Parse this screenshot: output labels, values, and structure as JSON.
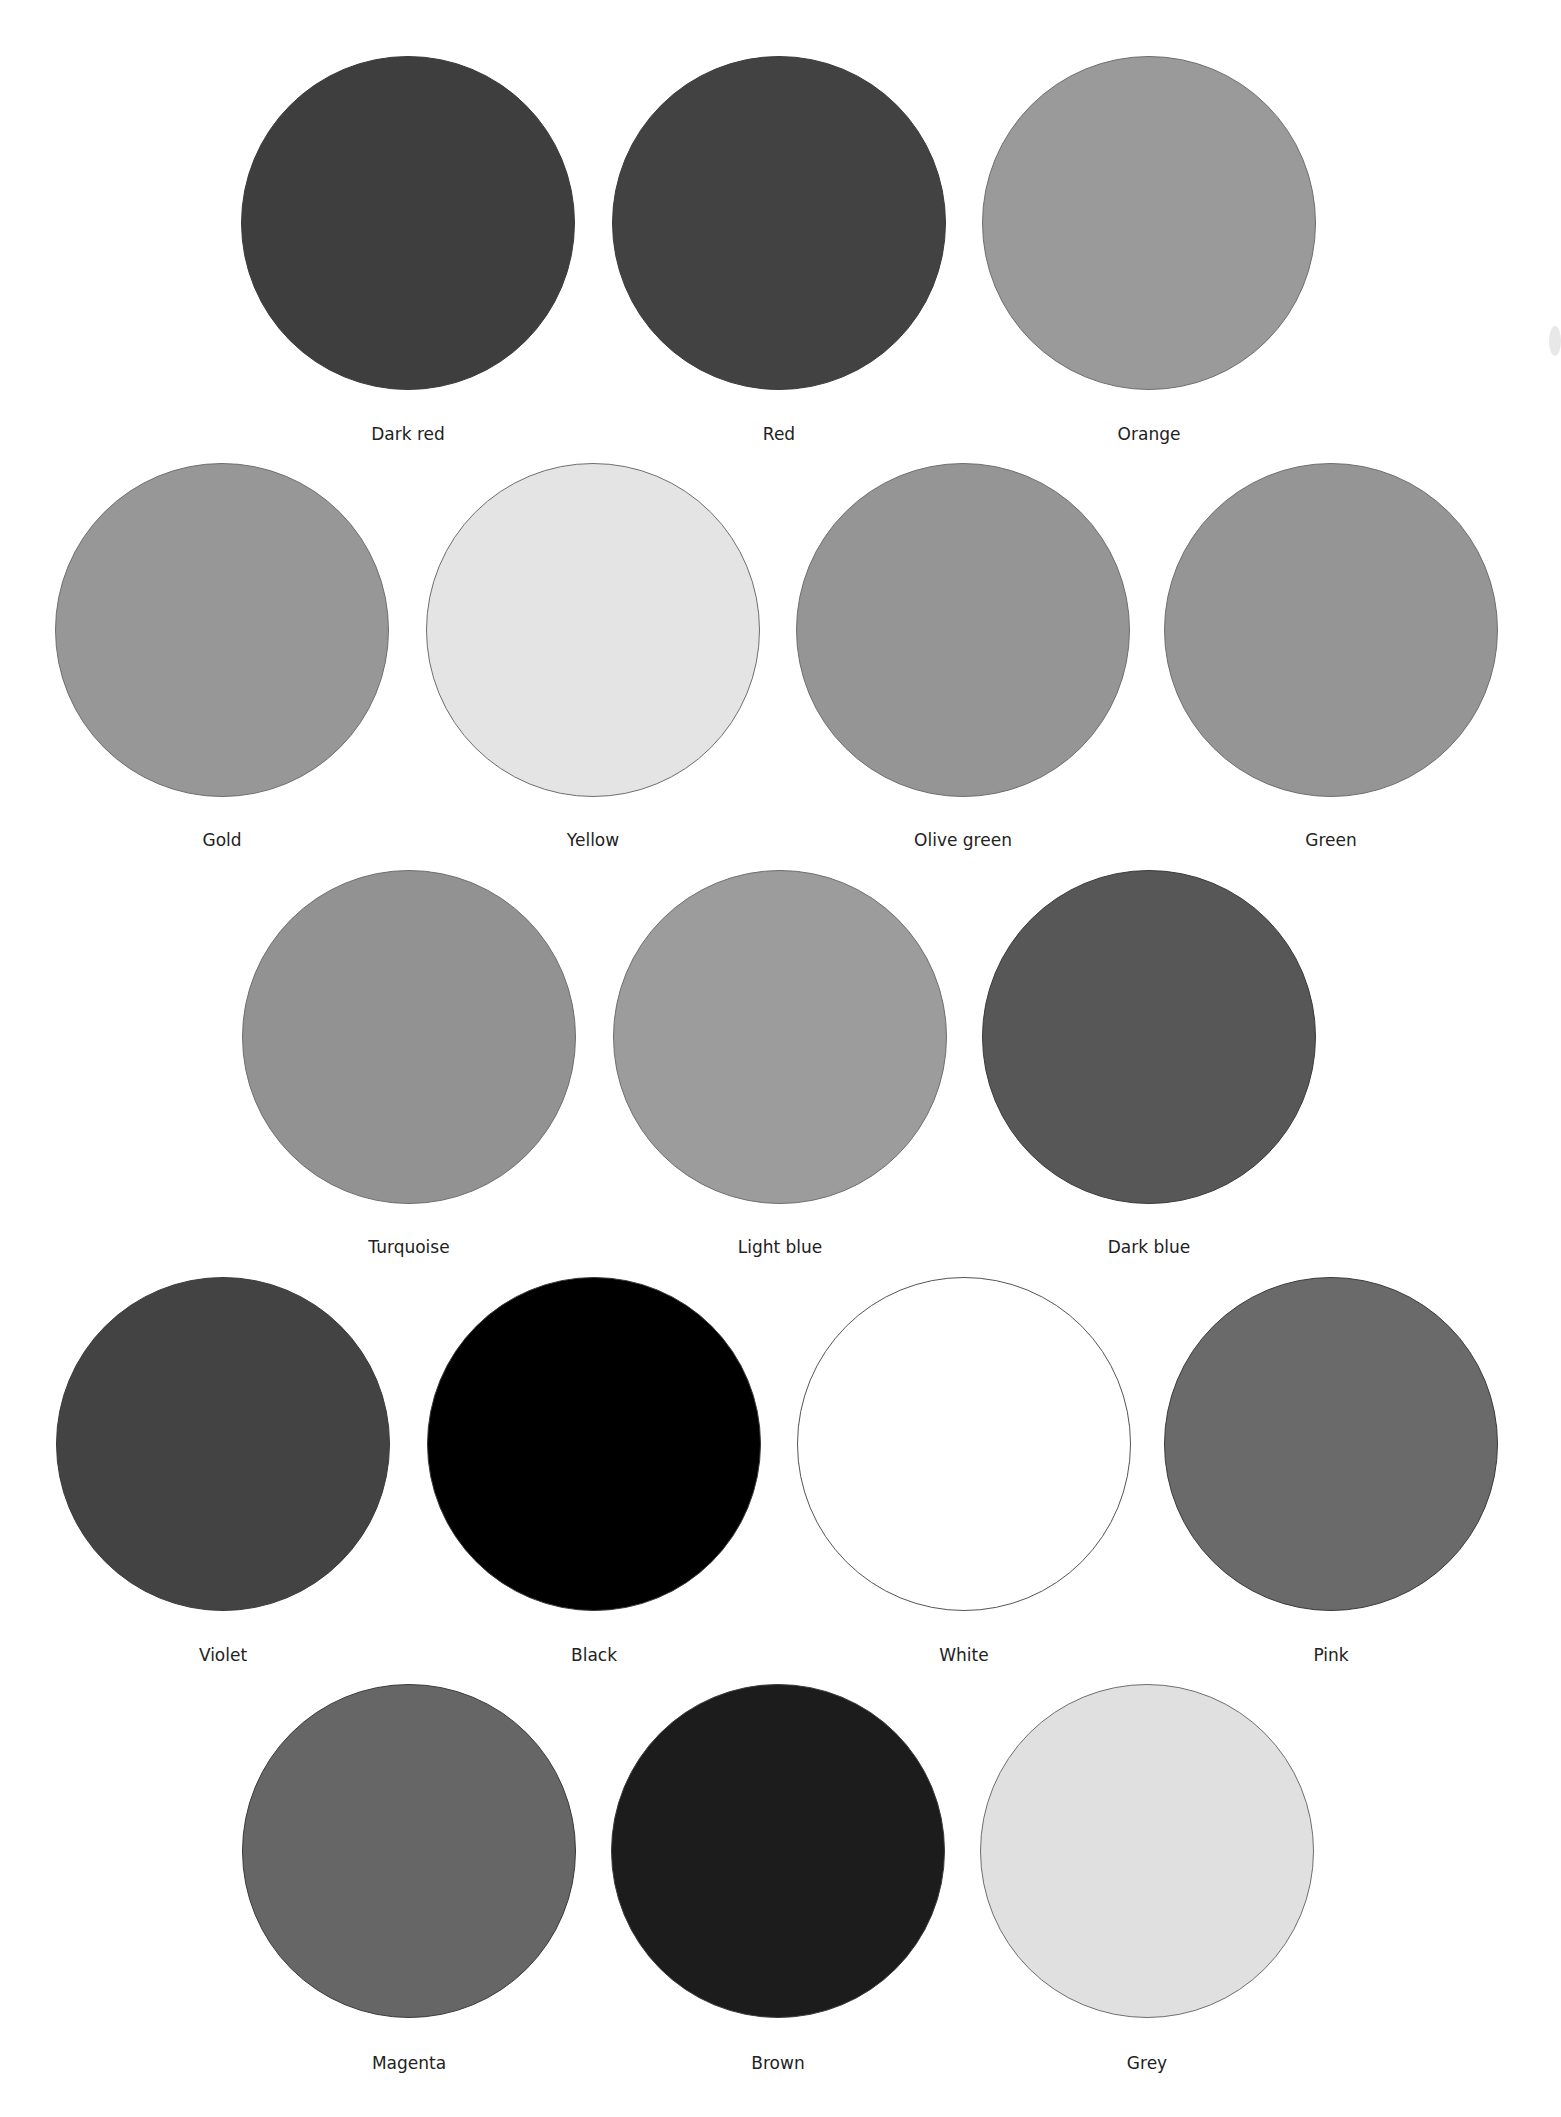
{
  "page": {
    "background": "#ffffff",
    "label_color": "#222222"
  },
  "chart_data": {
    "type": "table",
    "title": "",
    "rows": [
      {
        "items": [
          {
            "name": "Dark red",
            "fill": "#3e3e3e",
            "cx": 408,
            "cy": 223
          },
          {
            "name": "Red",
            "fill": "#424242",
            "cx": 779,
            "cy": 223
          },
          {
            "name": "Orange",
            "fill": "#9a9a9a",
            "cx": 1149,
            "cy": 223
          }
        ],
        "label_y": 424
      },
      {
        "items": [
          {
            "name": "Gold",
            "fill": "#979797",
            "cx": 222,
            "cy": 630
          },
          {
            "name": "Yellow",
            "fill": "#e4e4e4",
            "cx": 593,
            "cy": 630
          },
          {
            "name": "Olive green",
            "fill": "#959595",
            "cx": 963,
            "cy": 630
          },
          {
            "name": "Green",
            "fill": "#959595",
            "cx": 1331,
            "cy": 630
          }
        ],
        "label_y": 830
      },
      {
        "items": [
          {
            "name": "Turquoise",
            "fill": "#929292",
            "cx": 409,
            "cy": 1037
          },
          {
            "name": "Light blue",
            "fill": "#9c9c9c",
            "cx": 780,
            "cy": 1037
          },
          {
            "name": "Dark blue",
            "fill": "#575757",
            "cx": 1149,
            "cy": 1037
          }
        ],
        "label_y": 1237
      },
      {
        "items": [
          {
            "name": "Violet",
            "fill": "#434343",
            "cx": 223,
            "cy": 1444
          },
          {
            "name": "Black",
            "fill": "#000000",
            "cx": 594,
            "cy": 1444
          },
          {
            "name": "White",
            "fill": "#ffffff",
            "cx": 964,
            "cy": 1444
          },
          {
            "name": "Pink",
            "fill": "#6a6a6a",
            "cx": 1331,
            "cy": 1444
          }
        ],
        "label_y": 1645
      },
      {
        "items": [
          {
            "name": "Magenta",
            "fill": "#666666",
            "cx": 409,
            "cy": 1851
          },
          {
            "name": "Brown",
            "fill": "#1c1c1c",
            "cx": 778,
            "cy": 1851
          },
          {
            "name": "Grey",
            "fill": "#e0e0e0",
            "cx": 1147,
            "cy": 1851
          }
        ],
        "label_y": 2053
      }
    ],
    "swatch_diameter": 334
  }
}
